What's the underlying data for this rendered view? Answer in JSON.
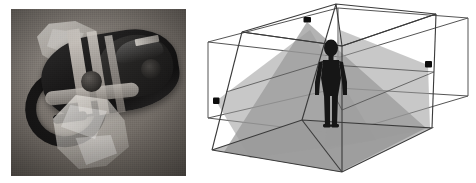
{
  "figure": {
    "width": 476,
    "height": 183,
    "background": "#ffffff",
    "panel_count": 2
  },
  "left_panel": {
    "name": "vr-headset-photograph",
    "type": "photograph",
    "color_mode": "grayscale",
    "subject": "virtual reality head-mounted display resting on ice-like crystal blocks",
    "frame": {
      "x": 11,
      "y": 9,
      "width": 175,
      "height": 167
    },
    "parts": [
      {
        "label": "headset-body",
        "tone": "#1a1919"
      },
      {
        "label": "headset-faceplate",
        "tone": "#242322"
      },
      {
        "label": "head-strap-band",
        "tone": "#a8a29c"
      },
      {
        "label": "head-strap-loop",
        "tone": "#171616"
      },
      {
        "label": "adjustment-knob",
        "tone": "#5e5a56"
      },
      {
        "label": "crystal-block-upper",
        "tone": "#ece9e4"
      },
      {
        "label": "crystal-block-lower",
        "tone": "#c6c2bc"
      },
      {
        "label": "studio-backdrop",
        "tone": "#6a645e"
      }
    ],
    "colors": {
      "backdrop": "#6a645e",
      "headset_dark": "#1a1919",
      "strap_light": "#b6b1ab",
      "crystal": "#e4e1dc"
    }
  },
  "right_panel": {
    "name": "camera-coverage-room-diagram",
    "type": "3d-wireframe-diagram",
    "description": "Wireframe of a rectangular room with three mounted cameras whose shaded view cones overlap around a standing person",
    "frame": {
      "x": 190,
      "y": 0,
      "width": 286,
      "height": 183
    },
    "elements": [
      {
        "label": "outer-bounding-box",
        "kind": "wireframe-cuboid",
        "stroke": "#555555"
      },
      {
        "label": "inner-room-box",
        "kind": "wireframe-cuboid",
        "stroke": "#3a3a3a"
      },
      {
        "label": "ceiling-camera",
        "kind": "camera-node",
        "position": "ceiling-center",
        "coords": {
          "x": 307,
          "y": 20
        }
      },
      {
        "label": "left-wall-camera",
        "kind": "camera-node",
        "position": "left-wall",
        "coords": {
          "x": 216,
          "y": 100
        }
      },
      {
        "label": "right-wall-camera",
        "kind": "camera-node",
        "position": "right-wall",
        "coords": {
          "x": 428,
          "y": 64
        }
      },
      {
        "label": "ceiling-camera-cone",
        "kind": "view-cone",
        "source": "ceiling-camera"
      },
      {
        "label": "left-camera-cone",
        "kind": "view-cone",
        "source": "left-wall-camera"
      },
      {
        "label": "right-camera-cone",
        "kind": "view-cone",
        "source": "right-wall-camera"
      },
      {
        "label": "person-silhouette",
        "kind": "human-figure",
        "pose": "standing, arms at sides",
        "coords": {
          "x": 331,
          "y": 85
        }
      },
      {
        "label": "floor-plane",
        "kind": "surface"
      }
    ],
    "counts": {
      "cameras": 3,
      "view_cones": 3,
      "people": 1,
      "boxes": 2
    },
    "colors": {
      "wire_outer": "#555555",
      "wire_inner": "#3a3a3a",
      "cone_fill": "#9a9a9a",
      "cone_overlap": "#7e7e7e",
      "floor_fill": "#bcbcbc",
      "camera_node": "#0d0d0d",
      "person_fill": "#161616"
    }
  }
}
